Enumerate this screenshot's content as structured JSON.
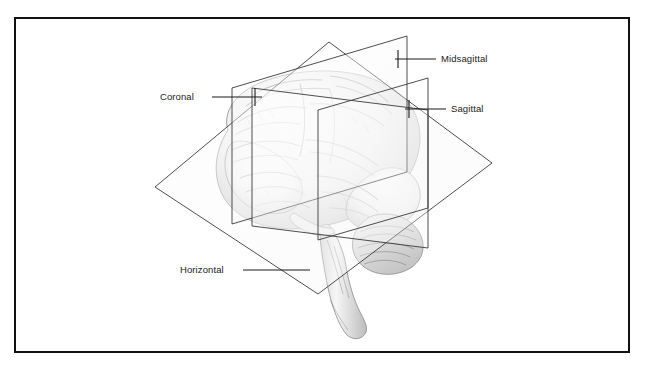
{
  "figure": {
    "kind": "anatomical-illustration",
    "background_color": "#ffffff",
    "frame_color": "#111111",
    "line_color": "#3a3a3a",
    "label_color": "#1a1a1a",
    "brain_ink_color": "#6e6e6e"
  },
  "labels": {
    "midsagittal": "Midsagittal",
    "sagittal": "Sagittal",
    "coronal": "Coronal",
    "horizontal": "Horizontal"
  },
  "planes": [
    {
      "name": "midsagittal",
      "label": "Midsagittal",
      "orientation": "vertical",
      "description": "vertical plane dividing the brain into left and right halves through the midline"
    },
    {
      "name": "sagittal",
      "label": "Sagittal",
      "orientation": "vertical",
      "description": "vertical plane parallel to the midline, offset to one side"
    },
    {
      "name": "coronal",
      "label": "Coronal",
      "orientation": "vertical",
      "description": "vertical plane dividing the brain into front and back portions"
    },
    {
      "name": "horizontal",
      "label": "Horizontal",
      "orientation": "horizontal",
      "description": "horizontal plane dividing the brain into upper and lower portions"
    }
  ]
}
